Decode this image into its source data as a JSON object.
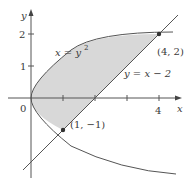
{
  "figure": {
    "axes": {
      "x_label": "x",
      "y_label": "y",
      "origin_label": "0",
      "x_tick_labels": [
        "4"
      ],
      "y_tick_labels": [
        "2",
        "1"
      ]
    },
    "curves": {
      "parabola_label": "x = y",
      "parabola_exponent": "2",
      "line_label": "y = x − 2"
    },
    "points": {
      "upper": "(4, 2)",
      "lower": "(1, −1)"
    },
    "colors": {
      "shade": "#d8d8d8",
      "stroke": "#555555",
      "axis": "#555555",
      "text": "#3a3a3a"
    }
  }
}
